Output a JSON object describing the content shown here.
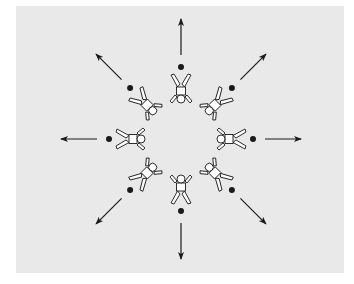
{
  "diagram": {
    "background_color": "#e9e9e9",
    "ink_color": "#1a1a1a",
    "figure_fill": "#ffffff",
    "center": [
      181,
      139
    ],
    "figure_count": 8,
    "positions": [
      {
        "id": "north",
        "angle": -90
      },
      {
        "id": "north-east",
        "angle": -45
      },
      {
        "id": "east",
        "angle": 0
      },
      {
        "id": "south-east",
        "angle": 45
      },
      {
        "id": "south",
        "angle": 90
      },
      {
        "id": "south-west",
        "angle": 135
      },
      {
        "id": "west",
        "angle": 180
      },
      {
        "id": "north-west",
        "angle": -135
      }
    ],
    "legend": {
      "figure": "player (head toward center)",
      "dot": "ball",
      "arrow": "direction of movement (outward)"
    }
  }
}
